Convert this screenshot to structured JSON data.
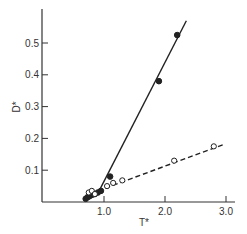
{
  "chart_data": {
    "type": "line",
    "title": "",
    "xlabel": "T*",
    "ylabel": "D*",
    "xlim": [
      0.0,
      3.1
    ],
    "ylim": [
      0.0,
      0.6
    ],
    "grid": false,
    "legend": null,
    "x_ticks": [
      {
        "value": 1.0,
        "label": "1.0"
      },
      {
        "value": 2.0,
        "label": "2.0"
      },
      {
        "value": 3.0,
        "label": "3.0"
      }
    ],
    "y_ticks": [
      {
        "value": 0.1,
        "label": "0.1"
      },
      {
        "value": 0.2,
        "label": "0.2"
      },
      {
        "value": 0.3,
        "label": "0.3"
      },
      {
        "value": 0.4,
        "label": "0.4"
      },
      {
        "value": 0.5,
        "label": "0.5"
      }
    ],
    "series": [
      {
        "name": "filled",
        "marker": "filled-circle",
        "line_style": "solid",
        "points": [
          {
            "x": 0.7,
            "y": 0.01
          },
          {
            "x": 0.73,
            "y": 0.015
          },
          {
            "x": 0.76,
            "y": 0.018
          },
          {
            "x": 0.8,
            "y": 0.022
          },
          {
            "x": 0.85,
            "y": 0.025
          },
          {
            "x": 0.9,
            "y": 0.03
          },
          {
            "x": 0.95,
            "y": 0.035
          },
          {
            "x": 1.1,
            "y": 0.08
          },
          {
            "x": 1.9,
            "y": 0.38
          },
          {
            "x": 2.2,
            "y": 0.525
          }
        ],
        "fit_line": [
          {
            "x": 0.88,
            "y": 0.02
          },
          {
            "x": 2.35,
            "y": 0.57
          }
        ]
      },
      {
        "name": "open",
        "marker": "open-circle",
        "line_style": "dashed",
        "points": [
          {
            "x": 0.75,
            "y": 0.03
          },
          {
            "x": 0.8,
            "y": 0.035
          },
          {
            "x": 0.85,
            "y": 0.025
          },
          {
            "x": 1.05,
            "y": 0.05
          },
          {
            "x": 1.15,
            "y": 0.06
          },
          {
            "x": 1.3,
            "y": 0.068
          },
          {
            "x": 2.15,
            "y": 0.13
          },
          {
            "x": 2.8,
            "y": 0.175
          }
        ],
        "fit_line": [
          {
            "x": 0.9,
            "y": 0.035
          },
          {
            "x": 2.95,
            "y": 0.18
          }
        ]
      }
    ]
  }
}
